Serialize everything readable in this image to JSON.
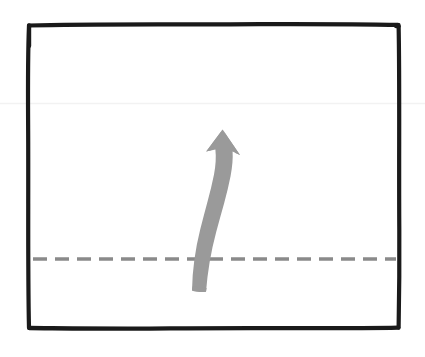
{
  "figure": {
    "title": "Hand-drawn diagram: curved upward arrow crossing a dashed horizontal baseline",
    "caption": "",
    "background_color": "#ffffff",
    "width": 425,
    "height": 357
  },
  "frame": {
    "name": "hand-drawn rectangle border",
    "color": "#1a1a1a",
    "stroke_width": 4,
    "left": 28,
    "top": 24,
    "right": 399,
    "bottom": 328
  },
  "baseline": {
    "name": "dashed horizontal reference line",
    "color": "#8a8a8a",
    "stroke_width": 3.4,
    "dash_length": 14,
    "gap_length": 8,
    "y": 259,
    "x_start": 33,
    "x_end": 396
  },
  "arrow": {
    "name": "curved upward arrow",
    "color": "#9a9a9a",
    "direction": "up",
    "tail_x": 215,
    "tail_y": 291,
    "tip_x": 222,
    "tip_y": 130,
    "crosses_baseline": true,
    "style": "hand-drawn tapered curve with angular arrowhead"
  },
  "artifacts": {
    "scan_line": {
      "name": "faint horizontal scan artifact",
      "color": "#f2f2f2",
      "y": 103
    }
  },
  "chart_data": {
    "type": "diagram",
    "xlabel": "",
    "ylabel": "",
    "elements": [
      {
        "kind": "rectangle-frame",
        "stroke": "#1a1a1a",
        "x": 28,
        "y": 24,
        "w": 371,
        "h": 304
      },
      {
        "kind": "dashed-line",
        "stroke": "#8a8a8a",
        "y": 259,
        "x1": 33,
        "x2": 396
      },
      {
        "kind": "arrow",
        "stroke": "#9a9a9a",
        "from": [
          215,
          291
        ],
        "to": [
          222,
          130
        ],
        "curvature": "bowed-right"
      }
    ],
    "annotations": [],
    "legend": [],
    "grid": false
  }
}
